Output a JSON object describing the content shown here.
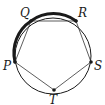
{
  "diagram": {
    "circle": {
      "cx": 53,
      "cy": 56,
      "r": 38
    },
    "vertices": [
      {
        "name": "P",
        "x": 15,
        "y": 62,
        "label_x": 3,
        "label_y": 70
      },
      {
        "name": "Q",
        "x": 31,
        "y": 21,
        "label_x": 20,
        "label_y": 17
      },
      {
        "name": "R",
        "x": 76,
        "y": 21,
        "label_x": 78,
        "label_y": 17
      },
      {
        "name": "S",
        "x": 91,
        "y": 62,
        "label_x": 94,
        "label_y": 70
      },
      {
        "name": "T",
        "x": 54,
        "y": 90,
        "label_x": 49,
        "label_y": 104
      }
    ],
    "highlighted_arc": [
      "P",
      "Q",
      "R"
    ],
    "colors": {
      "stroke": "#1a1a1a",
      "background": "#ffffff"
    }
  }
}
